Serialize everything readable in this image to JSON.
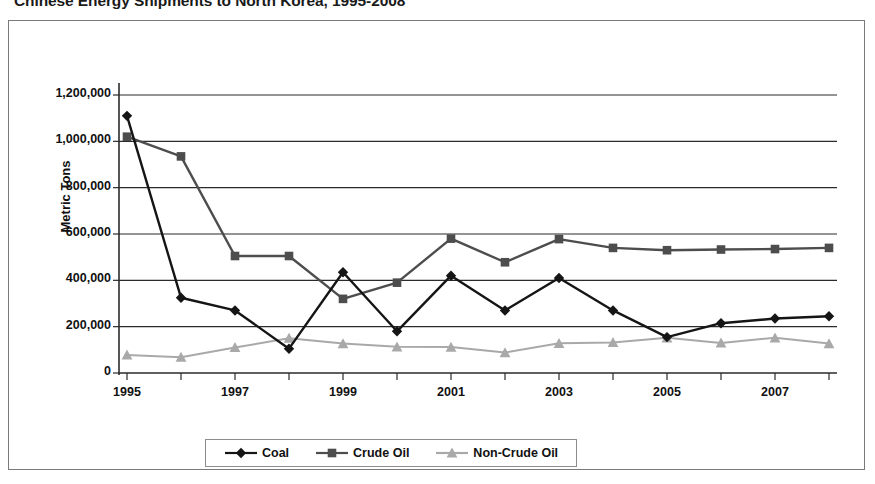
{
  "chart_title": "Chinese Energy Shipments to North Korea, 1995-2008",
  "axes": {
    "y_title": "Metric Tons",
    "y_ticks": [
      "1,200,000",
      "1,000,000",
      "800,000",
      "600,000",
      "400,000",
      "200,000",
      "0"
    ],
    "x_ticks": [
      "1995",
      "1997",
      "1999",
      "2001",
      "2003",
      "2005",
      "2007"
    ]
  },
  "legend": {
    "items": [
      {
        "label": "Coal",
        "marker": "diamond-marker-icon",
        "color": "#151515"
      },
      {
        "label": "Crude Oil",
        "marker": "square-marker-icon",
        "color": "#4d4d4d"
      },
      {
        "label": "Non-Crude Oil",
        "marker": "triangle-marker-icon",
        "color": "#a9a9a9"
      }
    ]
  },
  "chart_data": {
    "type": "line",
    "title": "Chinese Energy Shipments to North Korea, 1995-2008",
    "xlabel": "",
    "ylabel": "Metric Tons",
    "ylim": [
      0,
      1200000
    ],
    "ytick_step": 200000,
    "grid": true,
    "legend_position": "bottom",
    "x": [
      1995,
      1996,
      1997,
      1998,
      1999,
      2000,
      2001,
      2002,
      2003,
      2004,
      2005,
      2006,
      2007,
      2008
    ],
    "categories": [
      "1995",
      "1996",
      "1997",
      "1998",
      "1999",
      "2000",
      "2001",
      "2002",
      "2003",
      "2004",
      "2005",
      "2006",
      "2007",
      "2008"
    ],
    "series": [
      {
        "name": "Coal",
        "color": "#151515",
        "marker": "diamond",
        "values": [
          1110000,
          325000,
          270000,
          105000,
          435000,
          180000,
          420000,
          270000,
          410000,
          270000,
          155000,
          215000,
          235000,
          245000
        ]
      },
      {
        "name": "Crude Oil",
        "color": "#4d4d4d",
        "marker": "square",
        "values": [
          1020000,
          935000,
          505000,
          505000,
          320000,
          390000,
          580000,
          478000,
          578000,
          540000,
          530000,
          533000,
          535000,
          540000
        ]
      },
      {
        "name": "Non-Crude Oil",
        "color": "#a9a9a9",
        "marker": "triangle",
        "values": [
          78000,
          68000,
          110000,
          150000,
          127000,
          113000,
          112000,
          88000,
          128000,
          132000,
          152000,
          130000,
          152000,
          127000
        ]
      }
    ]
  }
}
